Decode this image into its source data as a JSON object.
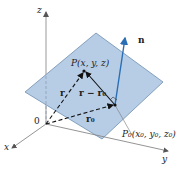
{
  "figure": {
    "type": "vector-plane-diagram",
    "axes": {
      "x_label": "x",
      "y_label": "y",
      "z_label": "z",
      "origin_label": "0"
    },
    "points": {
      "P_label": "P(x, y, z)",
      "P0_label": "P₀(x₀, y₀, z₀)"
    },
    "vectors": {
      "normal_label": "n",
      "r_label": "r",
      "r0_label": "r₀",
      "r_minus_r0_label": "r − r₀"
    },
    "colors": {
      "plane_fill": "#b7cde6",
      "plane_edge": "#6f8fb0",
      "normal_vector": "#2a6fb5",
      "axis": "#888888",
      "dashed_vector": "#1a1a1a"
    }
  }
}
